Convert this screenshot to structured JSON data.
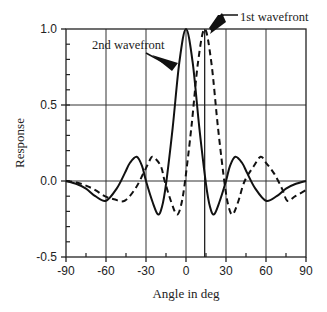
{
  "chart_data": {
    "type": "line",
    "title": "",
    "xlabel": "Angle in deg",
    "ylabel": "Response",
    "xlim": [
      -90,
      90
    ],
    "ylim": [
      -0.5,
      1.0
    ],
    "xticks": [
      "-90",
      "-60",
      "-30",
      "0",
      "30",
      "60",
      "90"
    ],
    "yticks": [
      "-0.5",
      "0.0",
      "0.5",
      "1.0"
    ],
    "grid": true,
    "marker_line_x": 14,
    "series": [
      {
        "name": "2nd wavefront",
        "style": "solid",
        "x": [
          -90,
          -82,
          -75,
          -68,
          -60,
          -52,
          -46,
          -42,
          -37,
          -33,
          -30,
          -25,
          -21,
          -18,
          -15,
          -10,
          -5,
          0,
          5,
          10,
          15,
          18,
          21,
          25,
          30,
          33,
          37,
          42,
          46,
          52,
          60,
          68,
          75,
          82,
          90
        ],
        "y": [
          0,
          -0.02,
          -0.05,
          -0.1,
          -0.13,
          -0.05,
          0.05,
          0.12,
          0.16,
          0.1,
          0,
          -0.14,
          -0.22,
          -0.17,
          -0.02,
          0.35,
          0.78,
          1.0,
          0.78,
          0.35,
          -0.02,
          -0.17,
          -0.22,
          -0.14,
          0,
          0.1,
          0.16,
          0.12,
          0.05,
          -0.05,
          -0.13,
          -0.1,
          -0.05,
          -0.02,
          0
        ]
      },
      {
        "name": "1st wavefront",
        "style": "dashed",
        "x": [
          -90,
          -82,
          -75,
          -68,
          -61,
          -54,
          -46,
          -38,
          -32,
          -28,
          -25,
          -19,
          -16,
          -11,
          -7,
          -4,
          -1,
          4,
          9,
          14,
          19,
          24,
          29,
          32,
          35,
          39,
          44,
          51,
          56,
          60,
          66,
          72,
          76,
          82,
          90
        ],
        "y": [
          0,
          -0.01,
          -0.03,
          -0.06,
          -0.1,
          -0.12,
          -0.13,
          -0.05,
          0.05,
          0.12,
          0.16,
          0.1,
          0,
          -0.14,
          -0.22,
          -0.17,
          -0.02,
          0.35,
          0.78,
          1.0,
          0.78,
          0.35,
          -0.02,
          -0.17,
          -0.22,
          -0.14,
          0,
          0.1,
          0.16,
          0.12,
          0.05,
          -0.05,
          -0.13,
          -0.1,
          -0.06
        ]
      }
    ],
    "annotations": [
      {
        "text": "1st wavefront",
        "target": "dashed peak"
      },
      {
        "text": "2nd wavefront",
        "target": "solid main lobe"
      }
    ]
  }
}
